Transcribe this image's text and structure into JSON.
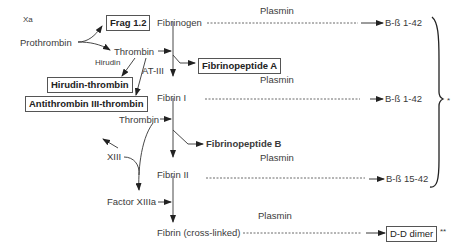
{
  "diagram": {
    "nodes": {
      "xa": "Xa",
      "frag12": "Frag 1.2",
      "prothrombin": "Prothrombin",
      "thrombin1": "Thrombin",
      "hirudin": "Hirudin",
      "at3": "AT-III",
      "hirudin_thrombin": "Hirudin-thrombin",
      "antithrombin_thrombin": "Antithrombin III-thrombin",
      "thrombin2": "Thrombin",
      "fibrinogen": "Fibrinogen",
      "fibrinopeptide_a": "Fibrinopeptide A",
      "fibrin1": "Fibrin I",
      "fibrinopeptide_b": "Fibrinopeptide B",
      "fibrin2": "Fibrin II",
      "xiii": "XIII",
      "factor_xiiia": "Factor XIIIa",
      "fibrin_crosslinked": "Fibrin (cross-linked)"
    },
    "plasmin_labels": [
      "Plasmin",
      "Plasmin",
      "Plasmin",
      "Plasmin"
    ],
    "products": {
      "bb1": "B-ß 1-42",
      "bb2": "B-ß 1-42",
      "bb3": "B-ß 15-42",
      "dd": "D-D dimer"
    },
    "annotations": {
      "brace_mark": "*",
      "dd_mark": "**"
    }
  }
}
